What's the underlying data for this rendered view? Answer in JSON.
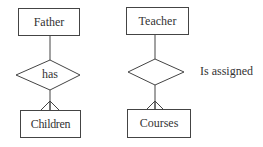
{
  "diagram": {
    "type": "entity-relationship",
    "stroke_color": "#444444",
    "left": {
      "top_entity": {
        "label": "Father"
      },
      "relationship": {
        "label": "has"
      },
      "bottom_entity": {
        "label": "Children"
      },
      "cardinality": "one-to-many"
    },
    "right": {
      "top_entity": {
        "label": "Teacher"
      },
      "relationship": {
        "label": ""
      },
      "relationship_side_label": "Is assigned",
      "bottom_entity": {
        "label": "Courses"
      },
      "cardinality": "one-to-many"
    }
  }
}
